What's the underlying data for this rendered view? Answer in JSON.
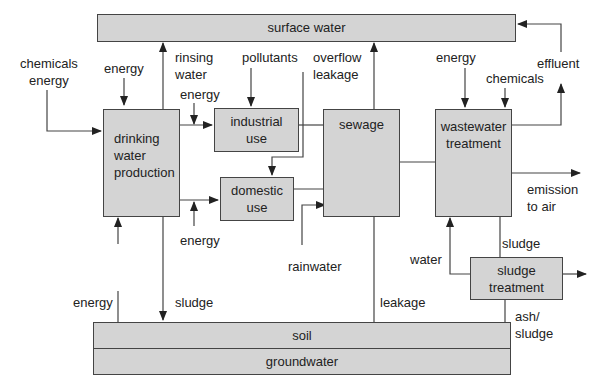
{
  "diagram": {
    "nodes": {
      "surface_water": "surface water",
      "drinking_water_production": [
        "drinking",
        "water",
        "production"
      ],
      "industrial_use": [
        "industrial",
        "use"
      ],
      "domestic_use": [
        "domestic",
        "use"
      ],
      "sewage": "sewage",
      "wastewater_treatment": [
        "wastewater",
        "treatment"
      ],
      "sludge_treatment": [
        "sludge",
        "treatment"
      ],
      "soil": "soil",
      "groundwater": "groundwater"
    },
    "labels": {
      "chemicals_energy": [
        "chemicals",
        "energy"
      ],
      "energy_top_left": "energy",
      "rinsing_water": [
        "rinsing",
        "water"
      ],
      "energy_industrial": "energy",
      "pollutants": "pollutants",
      "overflow_leakage": [
        "overflow",
        "leakage"
      ],
      "energy_wwt": "energy",
      "chemicals_wwt": "chemicals",
      "effluent": "effluent",
      "energy_domestic": "energy",
      "emission_to_air": [
        "emission",
        "to air"
      ],
      "rainwater": "rainwater",
      "water": "water",
      "sludge_wwt": "sludge",
      "energy_bottom": "energy",
      "sludge_dwp": "sludge",
      "leakage": "leakage",
      "ash_sludge": [
        "ash/",
        "sludge"
      ]
    },
    "colors": {
      "box_fill": "#d4d4d4",
      "line": "#444444"
    }
  }
}
